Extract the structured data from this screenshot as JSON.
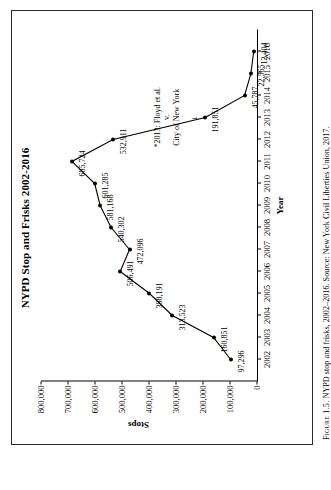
{
  "figure": {
    "caption_lead": "Figure 1.5.",
    "caption_text": " NYPD stop and frisks, 2002–2016. Source: New York Civil Liberties Union, 2017."
  },
  "chart_data": {
    "type": "line",
    "title": "NYPD Stop and Frisks 2002-2016",
    "xlabel": "Year",
    "ylabel": "Stops",
    "categories": [
      "2002",
      "2003",
      "2004",
      "2005",
      "2006",
      "2007",
      "2008",
      "2009",
      "2010",
      "2011",
      "2012",
      "2013",
      "2014",
      "2015",
      "2016"
    ],
    "values": [
      97296,
      160851,
      313523,
      398191,
      506491,
      472096,
      540302,
      581168,
      601285,
      685724,
      532911,
      191851,
      45787,
      22565,
      12404
    ],
    "point_labels": [
      "97,296",
      "160,851",
      "313,523",
      "398,191",
      "506,491",
      "472,096",
      "540,302",
      "581,168",
      "601,285",
      "685,724",
      "532,911",
      "191,851",
      "45,787",
      "22,565",
      "12,404"
    ],
    "ylim": [
      0,
      800000
    ],
    "yticks": [
      0,
      100000,
      200000,
      300000,
      400000,
      500000,
      600000,
      700000,
      800000
    ],
    "ytick_labels": [
      "0",
      "100,000",
      "200,000",
      "300,000",
      "400,000",
      "500,000",
      "600,000",
      "700,000",
      "800,000"
    ],
    "grid": false,
    "legend": "none",
    "annotations": [
      {
        "line1": "*2013: Floyd et al.",
        "line2": "v.",
        "line3": "City of New York",
        "arrow": "↓"
      }
    ]
  }
}
